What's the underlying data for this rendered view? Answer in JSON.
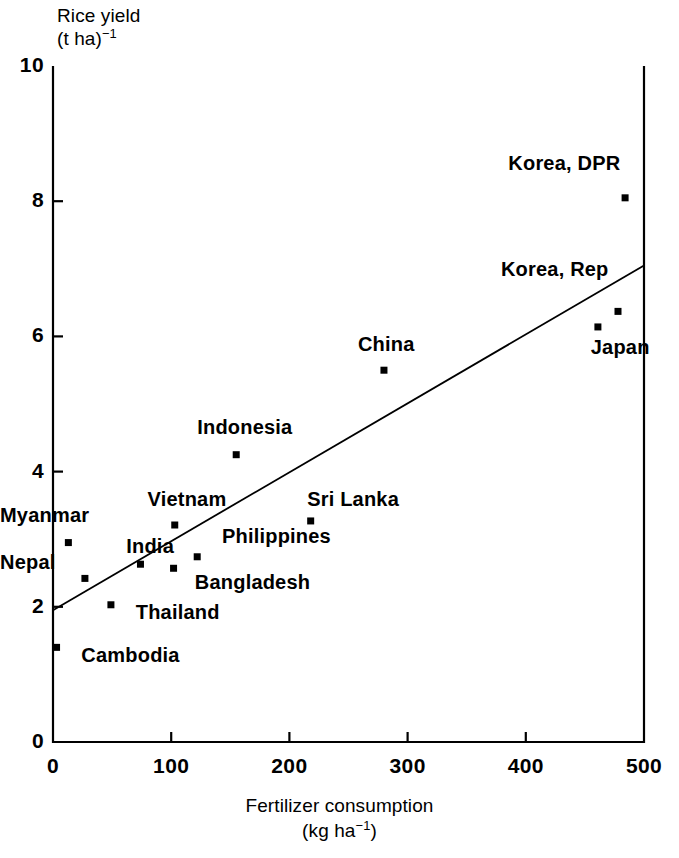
{
  "chart_data": {
    "type": "scatter",
    "title": "",
    "ylabel_line1": "Rice yield",
    "ylabel_line2_base": "(t ha)",
    "ylabel_line2_sup": "−1",
    "xlabel_line1": "Fertilizer consumption",
    "xlabel_line2_base": "(kg ha",
    "xlabel_line2_sup": "−1",
    "xlabel_line2_tail": ")",
    "xlim": [
      0,
      500
    ],
    "ylim": [
      0,
      10
    ],
    "xticks": [
      "0",
      "100",
      "200",
      "300",
      "400",
      "500"
    ],
    "xtick_values": [
      0,
      100,
      200,
      300,
      400,
      500
    ],
    "yticks": [
      "0",
      "2",
      "4",
      "6",
      "8",
      "10"
    ],
    "ytick_values": [
      0,
      2,
      4,
      6,
      8,
      10
    ],
    "grid": false,
    "legend": "none",
    "marker_color": "#000000",
    "line_color": "#000000",
    "axis_color": "#000000",
    "trendline": {
      "label": "regression-line",
      "x": [
        0,
        500
      ],
      "y": [
        1.95,
        7.05
      ]
    },
    "points": [
      {
        "name": "Cambodia",
        "x": 3,
        "y": 1.4,
        "label": "Cambodia",
        "label_x": 24,
        "label_y": 1.25,
        "label_anchor": "start"
      },
      {
        "name": "Nepal",
        "x": 27,
        "y": 2.42,
        "label": "Nepal",
        "label_x": 0,
        "label_y": 2.62,
        "label_anchor": "end"
      },
      {
        "name": "Myanmar",
        "x": 13,
        "y": 2.95,
        "label": "Myanmar",
        "label_x": 0,
        "label_y": 3.32,
        "label_anchor": "end"
      },
      {
        "name": "Thailand",
        "x": 49,
        "y": 2.03,
        "label": "Thailand",
        "label_x": 70,
        "label_y": 1.88,
        "label_anchor": "start"
      },
      {
        "name": "India",
        "x": 74,
        "y": 2.63,
        "label": "India",
        "label_x": 62,
        "label_y": 2.85,
        "label_anchor": "start"
      },
      {
        "name": "Vietnam",
        "x": 103,
        "y": 3.21,
        "label": "Vietnam",
        "label_x": 80,
        "label_y": 3.55,
        "label_anchor": "start"
      },
      {
        "name": "Bangladesh",
        "x": 102,
        "y": 2.57,
        "label": "Bangladesh",
        "label_x": 120,
        "label_y": 2.32,
        "label_anchor": "start"
      },
      {
        "name": "Philippines",
        "x": 122,
        "y": 2.74,
        "label": "Philippines",
        "label_x": 143,
        "label_y": 3.0,
        "label_anchor": "start"
      },
      {
        "name": "Sri Lanka",
        "x": 218,
        "y": 3.27,
        "label": "Sri Lanka",
        "label_x": 215,
        "label_y": 3.55,
        "label_anchor": "start"
      },
      {
        "name": "Indonesia",
        "x": 155,
        "y": 4.25,
        "label": "Indonesia",
        "label_x": 122,
        "label_y": 4.62,
        "label_anchor": "start"
      },
      {
        "name": "China",
        "x": 280,
        "y": 5.5,
        "label": "China",
        "label_x": 258,
        "label_y": 5.85,
        "label_anchor": "start"
      },
      {
        "name": "Japan",
        "x": 461,
        "y": 6.14,
        "label": "Japan",
        "label_x": 455,
        "label_y": 5.8,
        "label_anchor": "start"
      },
      {
        "name": "Korea, Rep",
        "x": 478,
        "y": 6.37,
        "label": "Korea, Rep",
        "label_x": 470,
        "label_y": 6.95,
        "label_anchor": "end"
      },
      {
        "name": "Korea, DPR",
        "x": 484,
        "y": 8.05,
        "label": "Korea, DPR",
        "label_x": 480,
        "label_y": 8.52,
        "label_anchor": "end"
      }
    ]
  }
}
